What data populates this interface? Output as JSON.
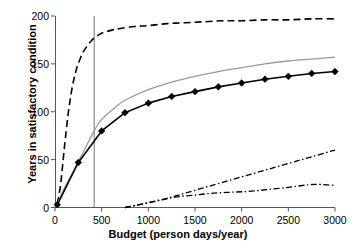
{
  "chart_data": {
    "type": "line",
    "title": "",
    "xlabel": "Budget (person days/year)",
    "ylabel": "Years in satisfactory condition",
    "xlim": [
      0,
      3000
    ],
    "ylim": [
      0,
      200
    ],
    "xticks": [
      0,
      500,
      1000,
      1500,
      2000,
      2500,
      3000
    ],
    "xticklabels": [
      "0",
      "500",
      "1000",
      "1500",
      "2000",
      "2500",
      "3000"
    ],
    "yticks": [
      0,
      50,
      100,
      150,
      200
    ],
    "yticklabels": [
      "0",
      "50",
      "100",
      "150",
      "200"
    ],
    "grid": false,
    "legend": "none",
    "annotations": [
      {
        "name": "vertical-reference-line",
        "type": "vline",
        "x": 420,
        "style": "solid-thin-gray"
      }
    ],
    "series": [
      {
        "name": "dashed-upper-curve",
        "style": "dashed",
        "color": "#000000",
        "width": 1.6,
        "markers": "none",
        "x": [
          25,
          60,
          100,
          140,
          180,
          220,
          260,
          300,
          340,
          380,
          420,
          500,
          600,
          700,
          850,
          1000,
          1200,
          1400,
          1600,
          1800,
          2000,
          2250,
          2500,
          2750,
          3000
        ],
        "y": [
          4,
          24,
          62,
          97,
          123,
          141,
          153,
          162,
          168,
          173,
          177,
          182,
          185,
          187,
          189,
          190,
          192,
          193,
          194,
          195,
          195,
          196,
          196,
          197,
          197
        ]
      },
      {
        "name": "gray-solid-curve",
        "style": "solid",
        "color": "#9a9a9a",
        "width": 1.3,
        "markers": "none",
        "x": [
          25,
          100,
          250,
          420,
          500,
          650,
          750,
          1000,
          1250,
          1500,
          1750,
          2000,
          2250,
          2500,
          2750,
          3000
        ],
        "y": [
          3,
          20,
          48,
          80,
          92,
          105,
          112,
          123,
          131,
          137,
          142,
          146,
          150,
          153,
          155,
          157
        ]
      },
      {
        "name": "black-diamond-marker-curve",
        "style": "solid",
        "color": "#000000",
        "width": 1.6,
        "markers": "diamond",
        "x": [
          25,
          250,
          500,
          750,
          1000,
          1250,
          1500,
          1750,
          2000,
          2250,
          2500,
          2750,
          3000
        ],
        "y": [
          3,
          47,
          80,
          99,
          109,
          116,
          121,
          126,
          130,
          134,
          137,
          140,
          142
        ]
      },
      {
        "name": "rising-dash-dot-curve",
        "style": "dash-dot",
        "color": "#000000",
        "width": 1.3,
        "markers": "none",
        "x": [
          750,
          850,
          1000,
          1250,
          1500,
          1750,
          2000,
          2250,
          2500,
          2750,
          3000
        ],
        "y": [
          0,
          2,
          5,
          11,
          18,
          25,
          32,
          39,
          46,
          53,
          60
        ]
      },
      {
        "name": "flat-dash-dot-curve",
        "style": "dash-dot",
        "color": "#000000",
        "width": 1.3,
        "markers": "none",
        "x": [
          750,
          850,
          1000,
          1150,
          1300,
          1500,
          1700,
          1900,
          2100,
          2300,
          2500,
          2650,
          2750,
          2850,
          3000
        ],
        "y": [
          0,
          2,
          5,
          8,
          11,
          13,
          15,
          16,
          17,
          19,
          21,
          23,
          24,
          24,
          23
        ]
      }
    ]
  }
}
